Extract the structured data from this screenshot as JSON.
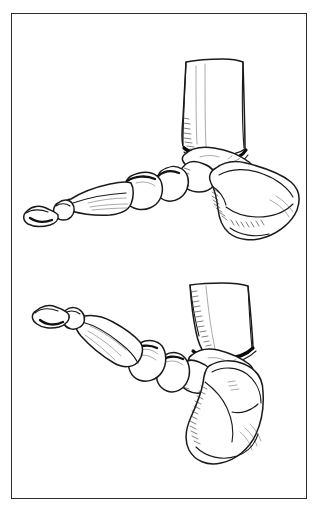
{
  "page": {
    "title": "Foot and ankle skeletal illustration",
    "background_color": "#ffffff",
    "width": 319,
    "height": 515
  },
  "frame": {
    "name": "illustration-border",
    "color": "#2b2b2b",
    "left": 11,
    "top": 13,
    "width": 296,
    "height": 486
  },
  "illustration": {
    "style": "pen-and-ink line drawing",
    "line_color": "#1a1a1a",
    "fill_color": "#ffffff",
    "shading_color": "#3a3a3a",
    "joint_line_color": "#0a0a0a",
    "subject": "lateral view of human foot and ankle skeleton",
    "panel_count": 2,
    "panels": [
      {
        "id": "upper",
        "name": "foot-neutral-position",
        "position": "top",
        "description": "Lateral view of foot and ankle in neutral / dorsiflexed position with tibia vertical",
        "bones": [
          "tibia",
          "fibula",
          "talus",
          "calcaneus",
          "navicular",
          "cuneiform",
          "metatarsal",
          "proximal phalanx"
        ]
      },
      {
        "id": "lower",
        "name": "foot-plantarflexed-position",
        "position": "bottom",
        "description": "Lateral view of foot and ankle in plantarflexed / equinus position with forefoot angled upward and calcaneus rotated downward",
        "bones": [
          "tibia",
          "fibula",
          "talus",
          "calcaneus",
          "navicular",
          "cuneiform",
          "metatarsal",
          "proximal phalanx"
        ]
      }
    ]
  }
}
